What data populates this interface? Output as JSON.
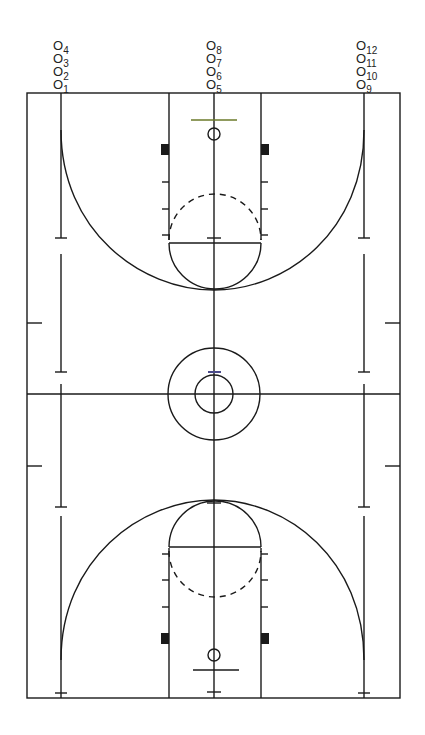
{
  "diagram": {
    "type": "basketball-court",
    "orientation": "vertical",
    "colors": {
      "lines": "#1a1a1a",
      "background": "#ffffff",
      "accent_ft_line": "#6b7a2a",
      "accent_center_tick": "#4a4a8a"
    }
  },
  "positions": [
    {
      "id": "4",
      "symbol": "O",
      "sub": "4",
      "column": "left"
    },
    {
      "id": "3",
      "symbol": "O",
      "sub": "3",
      "column": "left"
    },
    {
      "id": "2",
      "symbol": "O",
      "sub": "2",
      "column": "left"
    },
    {
      "id": "1",
      "symbol": "O",
      "sub": "1",
      "column": "left"
    },
    {
      "id": "8",
      "symbol": "O",
      "sub": "8",
      "column": "center"
    },
    {
      "id": "7",
      "symbol": "O",
      "sub": "7",
      "column": "center"
    },
    {
      "id": "6",
      "symbol": "O",
      "sub": "6",
      "column": "center"
    },
    {
      "id": "5",
      "symbol": "O",
      "sub": "5",
      "column": "center"
    },
    {
      "id": "12",
      "symbol": "O",
      "sub": "12",
      "column": "right"
    },
    {
      "id": "11",
      "symbol": "O",
      "sub": "11",
      "column": "right"
    },
    {
      "id": "10",
      "symbol": "O",
      "sub": "10",
      "column": "right"
    },
    {
      "id": "9",
      "symbol": "O",
      "sub": "9",
      "column": "right"
    }
  ]
}
